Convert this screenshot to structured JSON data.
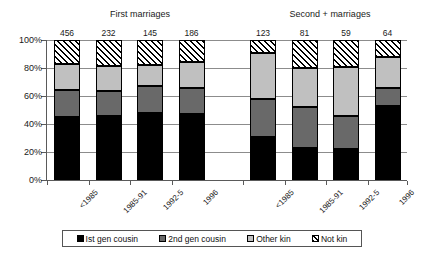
{
  "chart_data": {
    "type": "bar",
    "subtype": "stacked-percentage",
    "title": "",
    "xlabel": "",
    "ylabel": "",
    "ylim": [
      0,
      100
    ],
    "ytick_labels": [
      "0%",
      "20%",
      "40%",
      "60%",
      "80%",
      "100%"
    ],
    "ytick_values": [
      0,
      20,
      40,
      60,
      80,
      100
    ],
    "grid": "horizontal",
    "legend_position": "bottom",
    "legend": [
      "Ist gen cousin",
      "2nd gen cousin",
      "Other kin",
      "Not kin"
    ],
    "series": [
      {
        "name": "Ist gen cousin",
        "color": "#000000",
        "values": [
          45,
          45.5,
          48,
          47,
          31,
          23,
          22,
          53
        ]
      },
      {
        "name": "2nd gen cousin",
        "color": "#696969",
        "values": [
          19,
          18,
          19,
          19,
          27,
          29,
          24,
          13
        ]
      },
      {
        "name": "Other kin",
        "color": "#c0c0c0",
        "values": [
          19,
          18,
          15,
          18,
          33,
          28,
          35,
          22
        ]
      },
      {
        "name": "Not kin",
        "color": "hatched",
        "values": [
          17,
          18.5,
          18,
          16,
          9,
          20,
          19,
          12
        ]
      }
    ],
    "groups": [
      {
        "label": "First marriages",
        "categories": [
          "<1985",
          "1985-91",
          "1992-5",
          "1996"
        ],
        "counts": [
          "456",
          "232",
          "145",
          "186"
        ]
      },
      {
        "label": "Second + marriages",
        "categories": [
          "<1985",
          "1985-91",
          "1992-5",
          "1996"
        ],
        "counts": [
          "123",
          "81",
          "59",
          "64"
        ]
      }
    ],
    "bars": [
      {
        "group": 0,
        "category": "<1985",
        "count": "456",
        "segments": [
          45,
          19,
          19,
          17
        ]
      },
      {
        "group": 0,
        "category": "1985-91",
        "count": "232",
        "segments": [
          45.5,
          18,
          18,
          18.5
        ]
      },
      {
        "group": 0,
        "category": "1992-5",
        "count": "145",
        "segments": [
          48,
          19,
          15,
          18
        ]
      },
      {
        "group": 0,
        "category": "1996",
        "count": "186",
        "segments": [
          47,
          19,
          18,
          16
        ]
      },
      {
        "group": 1,
        "category": "<1985",
        "count": "123",
        "segments": [
          31,
          27,
          33,
          9
        ]
      },
      {
        "group": 1,
        "category": "1985-91",
        "count": "81",
        "segments": [
          23,
          29,
          28,
          20
        ]
      },
      {
        "group": 1,
        "category": "1992-5",
        "count": "59",
        "segments": [
          22,
          24,
          35,
          19
        ]
      },
      {
        "group": 1,
        "category": "1996",
        "count": "64",
        "segments": [
          53,
          13,
          22,
          12
        ]
      }
    ]
  }
}
